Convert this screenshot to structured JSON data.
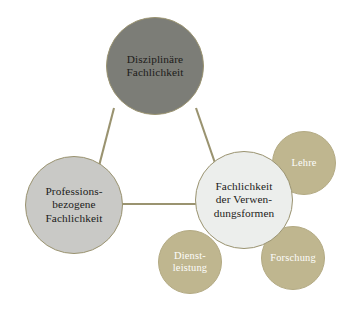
{
  "diagram": {
    "type": "node-link concept diagram",
    "background_color": "#ffffff",
    "line_color": "#9a9370",
    "nodes": [
      {
        "id": "disziplinaere",
        "label": "Disziplinäre\nFachlichkeit",
        "role": "primary",
        "fill": "#7c7d77",
        "text_color": "#1c1c1a"
      },
      {
        "id": "professions",
        "label": "Professions-\nbezogene\nFachlichkeit",
        "role": "primary",
        "fill": "#c9c9c6",
        "text_color": "#1c1c1a"
      },
      {
        "id": "verwendungsformen",
        "label": "Fachlichkeit\nder Verwen-\ndungsformen",
        "role": "primary",
        "fill": "#eceeec",
        "text_color": "#1c1c1a"
      },
      {
        "id": "lehre",
        "label": "Lehre",
        "role": "satellite",
        "fill": "#bfb68f",
        "text_color": "#fdfdfb"
      },
      {
        "id": "dienstleistung",
        "label": "Dienst-\nleistung",
        "role": "satellite",
        "fill": "#bfb68f",
        "text_color": "#fdfdfb"
      },
      {
        "id": "forschung",
        "label": "Forschung",
        "role": "satellite",
        "fill": "#bfb68f",
        "text_color": "#fdfdfb"
      }
    ],
    "edges": [
      {
        "from": "disziplinaere",
        "to": "professions"
      },
      {
        "from": "disziplinaere",
        "to": "verwendungsformen"
      },
      {
        "from": "professions",
        "to": "verwendungsformen"
      }
    ]
  }
}
